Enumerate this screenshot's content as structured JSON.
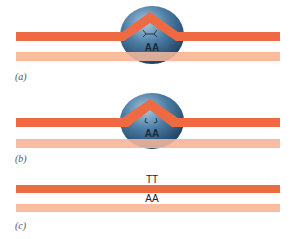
{
  "colors": {
    "strand_dark": "#ee6a43",
    "strand_light": "#f9bca0",
    "enzyme_dark": "#1f4466",
    "enzyme_light": "#8fb6d2",
    "text": "#222222",
    "label": "#555555"
  },
  "panels": [
    {
      "label": "(a)",
      "enzyme_text": "AA",
      "lesion_glyph": ">-<"
    },
    {
      "label": "(b)",
      "enzyme_text": "AA",
      "lesion_glyph": ">-<"
    },
    {
      "label": "(c)",
      "top_text": "TT",
      "bottom_text": "AA"
    }
  ]
}
